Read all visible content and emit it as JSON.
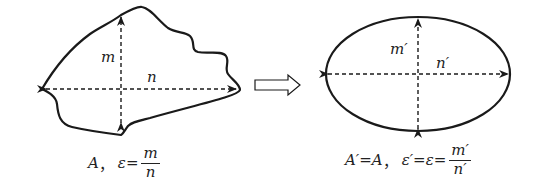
{
  "left_figure": {
    "label_vertical": "m",
    "label_horizontal": "n",
    "caption": {
      "area": "A",
      "separator": "，",
      "lhs": "ε=",
      "numerator": "m",
      "denominator": "n"
    }
  },
  "transform_arrow": "hollow-right-arrow",
  "right_figure": {
    "label_vertical": "m′",
    "label_horizontal": "n′",
    "caption": {
      "area_eq": "A′=A",
      "separator": "，",
      "lhs": "ε′=ε=",
      "numerator": "m′",
      "denominator": "n′"
    }
  },
  "colors": {
    "stroke": "#1a1a1a",
    "background": "#ffffff"
  }
}
